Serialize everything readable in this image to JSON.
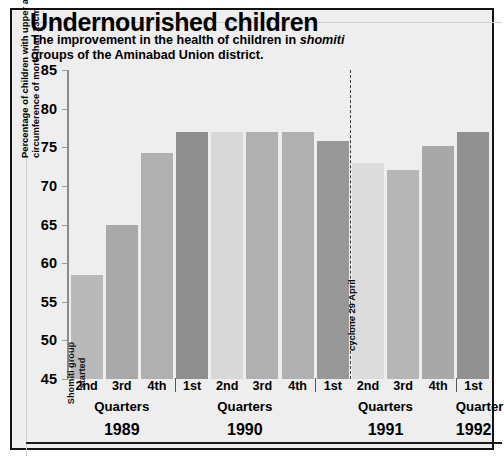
{
  "header": {
    "title": "Undernourished children",
    "subtitle_pre": "The improvement in the health of children in ",
    "subtitle_italic": "shomiti",
    "subtitle_post": " groups of the Aminabad Union district."
  },
  "chart_data": {
    "type": "bar",
    "title": "Undernourished children",
    "subtitle": "The improvement in the health of children in shomiti groups of the Aminabad Union district.",
    "xlabel": "Quarters",
    "ylabel": "Percentage of children with upper arm circumference of more than 13cm",
    "ylim": [
      45,
      85
    ],
    "yticks": [
      45,
      50,
      55,
      60,
      65,
      70,
      75,
      80,
      85
    ],
    "grid": false,
    "legend": "none",
    "categories": [
      "2nd",
      "3rd",
      "4th",
      "1st",
      "2nd",
      "3rd",
      "4th",
      "1st",
      "2nd",
      "3rd",
      "4th",
      "1st"
    ],
    "years": [
      "1989",
      "1989",
      "1989",
      "1990",
      "1990",
      "1990",
      "1990",
      "1991",
      "1991",
      "1991",
      "1991",
      "1992"
    ],
    "values": [
      58.5,
      64.9,
      74.3,
      77.0,
      77.0,
      77.0,
      77.0,
      75.8,
      73.0,
      72.0,
      75.2,
      77.0
    ],
    "bar_colors": [
      "#b9b9b9",
      "#a9a9a9",
      "#b0b0b0",
      "#8f8f8f",
      "#d8d8d8",
      "#b0b0b0",
      "#b0b0b0",
      "#989898",
      "#dcdcdc",
      "#b6b6b6",
      "#a8a8a8",
      "#909090"
    ],
    "annotations": [
      {
        "name": "shomiti-start",
        "text_lines": [
          "Shomiti group",
          "started"
        ],
        "at_category_index": 0
      },
      {
        "name": "cyclone-marker",
        "text": "cyclone 29 April",
        "between_category_index": 7,
        "style": "dashed-vertical-line"
      }
    ],
    "groups": [
      {
        "year": "1989",
        "quarters_label": "Quarters",
        "quarters": [
          "2nd",
          "3rd",
          "4th"
        ]
      },
      {
        "year": "1990",
        "quarters_label": "Quarters",
        "quarters": [
          "1st",
          "2nd",
          "3rd",
          "4th"
        ]
      },
      {
        "year": "1991",
        "quarters_label": "Quarters",
        "quarters": [
          "1st",
          "2nd",
          "3rd",
          "4th"
        ]
      },
      {
        "year": "1992",
        "quarters_label": "Quarters",
        "quarters": [
          "1st"
        ]
      }
    ]
  },
  "axis": {
    "y_title_line1": "Percentage of children with upper arm",
    "y_title_line2": "circumference of more than 13cm",
    "y_tick_labels": [
      "85",
      "80",
      "75",
      "70",
      "65",
      "60",
      "55",
      "50",
      "45"
    ]
  },
  "labels": {
    "quarters_word": "Quarters"
  },
  "colors": {
    "panel_bg": "#eeeeee",
    "frame": "#141414",
    "axis": "#8a8a8a",
    "text": "#000000"
  }
}
